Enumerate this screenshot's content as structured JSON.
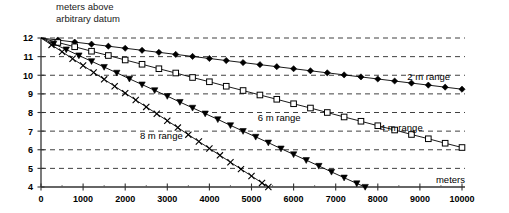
{
  "chart_data": {
    "type": "line",
    "title": "meters above\narbitrary datum",
    "xlabel": "meters",
    "ylabel": "meters above arbitrary datum",
    "xlim": [
      0,
      10000
    ],
    "ylim": [
      4,
      12
    ],
    "xticks": [
      0,
      1000,
      2000,
      3000,
      4000,
      5000,
      6000,
      7000,
      8000,
      9000,
      10000
    ],
    "yticks": [
      4,
      5,
      6,
      7,
      8,
      9,
      10,
      11,
      12
    ],
    "grid": "horizontal-dashed",
    "legend": "inline-annotations",
    "series": [
      {
        "name": "2 m range",
        "marker": "filled-diamond",
        "label_x": 8700,
        "label_y": 9.75,
        "x": [
          0,
          400,
          800,
          1200,
          1600,
          2000,
          2400,
          2800,
          3200,
          3600,
          4000,
          4400,
          4800,
          5200,
          5600,
          6000,
          6400,
          6800,
          7200,
          7600,
          8000,
          8400,
          8800,
          9200,
          9600,
          10000
        ],
        "y": [
          12.0,
          11.89,
          11.78,
          11.67,
          11.56,
          11.45,
          11.34,
          11.23,
          11.12,
          11.01,
          10.9,
          10.79,
          10.68,
          10.57,
          10.46,
          10.35,
          10.24,
          10.13,
          10.02,
          9.91,
          9.8,
          9.69,
          9.58,
          9.47,
          9.36,
          9.25
        ]
      },
      {
        "name": "4 m range",
        "marker": "open-square",
        "label_x": 8050,
        "label_y": 7.0,
        "x": [
          0,
          400,
          800,
          1200,
          1600,
          2000,
          2400,
          2800,
          3200,
          3600,
          4000,
          4400,
          4800,
          5200,
          5600,
          6000,
          6400,
          6800,
          7200,
          7600,
          8000,
          8400,
          8800,
          9200,
          9600,
          10000
        ],
        "y": [
          12.0,
          11.76,
          11.53,
          11.29,
          11.06,
          10.82,
          10.59,
          10.35,
          10.12,
          9.88,
          9.65,
          9.41,
          9.18,
          8.94,
          8.71,
          8.47,
          8.24,
          8.0,
          7.76,
          7.53,
          7.29,
          7.06,
          6.82,
          6.59,
          6.35,
          6.12
        ]
      },
      {
        "name": "6 m range",
        "marker": "filled-triangle",
        "label_x": 5150,
        "label_y": 7.55,
        "x": [
          0,
          300,
          600,
          900,
          1200,
          1500,
          1800,
          2100,
          2400,
          2700,
          3000,
          3300,
          3600,
          3900,
          4200,
          4500,
          4800,
          5100,
          5400,
          5700,
          6000,
          6300,
          6600,
          6900,
          7200,
          7500,
          7700
        ],
        "y": [
          12.0,
          11.69,
          11.38,
          11.06,
          10.75,
          10.44,
          10.13,
          9.81,
          9.5,
          9.19,
          8.88,
          8.56,
          8.25,
          7.94,
          7.63,
          7.31,
          7.0,
          6.69,
          6.38,
          6.06,
          5.75,
          5.44,
          5.13,
          4.81,
          4.5,
          4.19,
          4.0
        ]
      },
      {
        "name": "8 m range",
        "marker": "cross",
        "label_x": 2350,
        "label_y": 6.6,
        "x": [
          0,
          250,
          500,
          750,
          1000,
          1250,
          1500,
          1750,
          2000,
          2250,
          2500,
          2750,
          3000,
          3250,
          3500,
          3750,
          4000,
          4250,
          4500,
          4750,
          5000,
          5250,
          5400
        ],
        "y": [
          12.0,
          11.63,
          11.26,
          10.89,
          10.52,
          10.15,
          9.78,
          9.41,
          9.04,
          8.67,
          8.3,
          7.93,
          7.56,
          7.19,
          6.81,
          6.44,
          6.07,
          5.7,
          5.33,
          4.96,
          4.59,
          4.22,
          4.0
        ]
      }
    ]
  }
}
